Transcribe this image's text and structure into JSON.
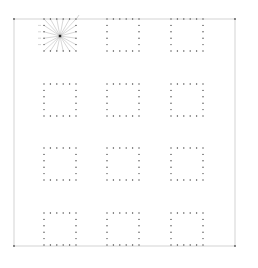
{
  "canvas": {
    "width": 258,
    "height": 268,
    "background": "#ffffff"
  },
  "frame": {
    "x1": 14,
    "y1": 19,
    "x2": 235,
    "y2": 246,
    "color": "#c8c8c8",
    "corner_dot_color": "#555555"
  },
  "grid": {
    "cols_x": [
      44,
      107,
      171
    ],
    "rows_y": [
      19,
      84,
      148,
      213
    ],
    "square_size": 32,
    "dots_per_side": 6,
    "dot_color": "#444444",
    "dot_radius": 0.7
  },
  "fan_square": {
    "row": 0,
    "col": 0,
    "center": [
      60,
      36
    ],
    "ray_color": "#b0b0b0",
    "center_color": "#222222",
    "labels_left": [
      "",
      "",
      "",
      "",
      "",
      ""
    ],
    "labels_right": [
      "",
      ""
    ]
  }
}
